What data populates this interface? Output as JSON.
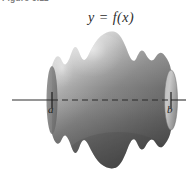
{
  "figure": {
    "caption": "Figure 6.11",
    "function_label": "y = f(x)",
    "axis_label_left": "a",
    "axis_label_right": "b"
  },
  "diagram": {
    "type": "solid-of-revolution",
    "axis": {
      "name": "x-axis",
      "y_position": 100,
      "x_start": 12,
      "x_end": 186,
      "solid_outside_style": "solid",
      "solid_inside_style": "dashed",
      "dash_pattern": "6 4",
      "color": "#2f2f2f",
      "width": 1.1
    },
    "interval": {
      "a_x": 52,
      "b_x": 171,
      "tick_half_height": 8
    },
    "profile": {
      "comment": "Upper half-profile radius samples across x from a to b (pixels above axis)",
      "x": [
        52,
        58,
        64,
        70,
        76,
        82,
        88,
        94,
        100,
        106,
        112,
        118,
        124,
        130,
        136,
        142,
        148,
        154,
        160,
        165,
        171
      ],
      "radius": [
        34,
        41,
        46,
        43,
        36,
        34,
        40,
        52,
        62,
        69,
        71,
        68,
        60,
        50,
        41,
        35,
        33,
        36,
        41,
        39,
        30
      ]
    },
    "colors": {
      "surface_light": "#d8d8d8",
      "surface_mid": "#8e8e8e",
      "surface_dark": "#5a5a5a",
      "surface_shadow": "#4a4a4a",
      "cap_light": "#c9c9c9",
      "cap_dark": "#8a8a8a",
      "outline": "#3c3c3c",
      "axis": "#2f2f2f",
      "text": "#1d1d1d",
      "background": "#ffffff"
    }
  }
}
